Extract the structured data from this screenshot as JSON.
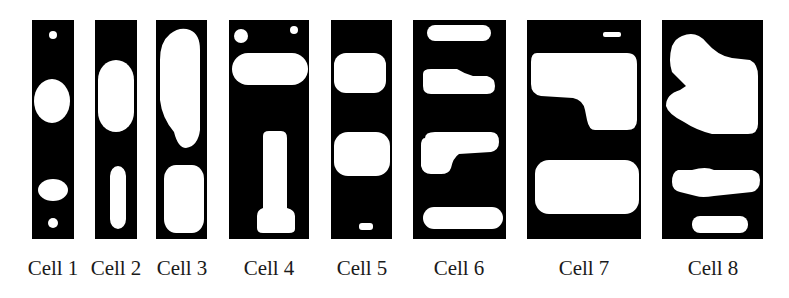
{
  "figure": {
    "background": "#ffffff",
    "panel_color": "#000000",
    "blob_color": "#ffffff",
    "cells": [
      {
        "label": "Cell 1"
      },
      {
        "label": "Cell 2"
      },
      {
        "label": "Cell 3"
      },
      {
        "label": "Cell 4"
      },
      {
        "label": "Cell 5"
      },
      {
        "label": "Cell 6"
      },
      {
        "label": "Cell 7"
      },
      {
        "label": "Cell 8"
      }
    ]
  }
}
